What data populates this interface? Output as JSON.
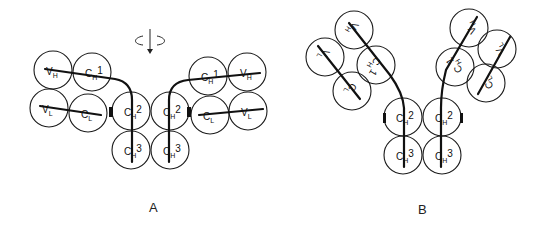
{
  "figure": {
    "panels": [
      {
        "id": "A",
        "label": "A",
        "description": "Antibody in T-shaped conformation with rotation symbol above",
        "rotation_symbol": "rotate-arrow-icon",
        "domains": [
          {
            "name": "VH",
            "main": "V",
            "sub": "H",
            "sup": "",
            "cx": 53,
            "cy": 70,
            "r": 19
          },
          {
            "name": "CH1",
            "main": "C",
            "sub": "H",
            "sup": "1",
            "cx": 92,
            "cy": 72,
            "r": 19
          },
          {
            "name": "VL",
            "main": "V",
            "sub": "L",
            "sup": "",
            "cx": 49,
            "cy": 108,
            "r": 19
          },
          {
            "name": "CL",
            "main": "C",
            "sub": "L",
            "sup": "",
            "cx": 88,
            "cy": 113,
            "r": 19
          },
          {
            "name": "CH2",
            "main": "C",
            "sub": "H",
            "sup": "2",
            "cx": 131,
            "cy": 111,
            "r": 19
          },
          {
            "name": "CH2",
            "main": "C",
            "sub": "H",
            "sup": "2",
            "cx": 170,
            "cy": 111,
            "r": 19
          },
          {
            "name": "CH3",
            "main": "C",
            "sub": "H",
            "sup": "3",
            "cx": 131,
            "cy": 150,
            "r": 19
          },
          {
            "name": "CH3",
            "main": "C",
            "sub": "H",
            "sup": "3",
            "cx": 170,
            "cy": 150,
            "r": 19
          },
          {
            "name": "CH1",
            "main": "C",
            "sub": "H",
            "sup": "1",
            "cx": 208,
            "cy": 76,
            "r": 19
          },
          {
            "name": "VH",
            "main": "V",
            "sub": "H",
            "sup": "",
            "cx": 247,
            "cy": 72,
            "r": 19
          },
          {
            "name": "CL",
            "main": "C",
            "sub": "L",
            "sup": "",
            "cx": 210,
            "cy": 115,
            "r": 19
          },
          {
            "name": "VL",
            "main": "V",
            "sub": "L",
            "sup": "",
            "cx": 248,
            "cy": 111,
            "r": 19
          }
        ]
      },
      {
        "id": "B",
        "label": "B",
        "description": "Antibody in Y-shaped conformation",
        "domains": [
          {
            "name": "VH",
            "main": "V",
            "sub": "H",
            "sup": "",
            "cx": 354,
            "cy": 30,
            "r": 19,
            "rot": 120
          },
          {
            "name": "VL",
            "main": "V",
            "sub": "L",
            "sup": "",
            "cx": 325,
            "cy": 57,
            "r": 19,
            "rot": 120
          },
          {
            "name": "CH1",
            "main": "C",
            "sub": "H",
            "sup": "1",
            "cx": 376,
            "cy": 65,
            "r": 19,
            "rot": 120
          },
          {
            "name": "CL",
            "main": "C",
            "sub": "L",
            "sup": "",
            "cx": 352,
            "cy": 91,
            "r": 19,
            "rot": 120
          },
          {
            "name": "CH2",
            "main": "C",
            "sub": "H",
            "sup": "2",
            "cx": 403,
            "cy": 117,
            "r": 19
          },
          {
            "name": "CH2",
            "main": "C",
            "sub": "H",
            "sup": "2",
            "cx": 442,
            "cy": 117,
            "r": 19
          },
          {
            "name": "CH3",
            "main": "C",
            "sub": "H",
            "sup": "3",
            "cx": 403,
            "cy": 155,
            "r": 19
          },
          {
            "name": "CH3",
            "main": "C",
            "sub": "H",
            "sup": "3",
            "cx": 442,
            "cy": 155,
            "r": 19
          },
          {
            "name": "VH",
            "main": "V",
            "sub": "H",
            "sup": "",
            "cx": 469,
            "cy": 28,
            "r": 19,
            "rot": -120
          },
          {
            "name": "VL",
            "main": "V",
            "sub": "L",
            "sup": "",
            "cx": 497,
            "cy": 49,
            "r": 19,
            "rot": -120
          },
          {
            "name": "CH1",
            "main": "C",
            "sub": "H",
            "sup": "1",
            "cx": 455,
            "cy": 67,
            "r": 19,
            "rot": -120
          },
          {
            "name": "CL",
            "main": "C",
            "sub": "L",
            "sup": "",
            "cx": 486,
            "cy": 83,
            "r": 19,
            "rot": -120
          }
        ]
      }
    ]
  }
}
